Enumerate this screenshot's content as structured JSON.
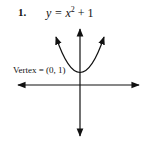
{
  "problem": {
    "number": "1.",
    "equation_lhs": "y = x",
    "exponent": "2",
    "equation_rhs": " + 1",
    "vertex_label": "Vertex = (0, 1)"
  },
  "graph": {
    "type": "parabola",
    "function": "y = x^2 + 1",
    "vertex": [
      0,
      1
    ],
    "opens": "up",
    "axes_color": "#111111",
    "curve_color": "#111111"
  }
}
